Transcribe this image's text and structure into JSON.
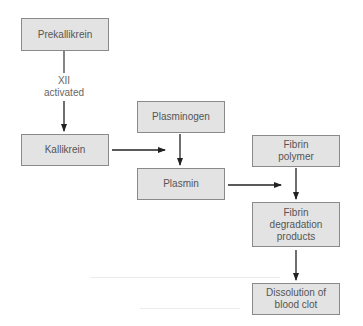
{
  "diagram": {
    "title": "",
    "nodes": [
      {
        "id": "prekallikrein",
        "label": "Prekallikrein"
      },
      {
        "id": "kallikrein",
        "label": "Kallikrein"
      },
      {
        "id": "plasminogen",
        "label": "Plasminogen"
      },
      {
        "id": "plasmin",
        "label": "Plasmin"
      },
      {
        "id": "fibrin_polymer",
        "label": "Fibrin\npolymer"
      },
      {
        "id": "fibrin_degradation",
        "label": "Fibrin\ndegradation\nproducts"
      },
      {
        "id": "dissolution",
        "label": "Dissolution of\nblood clot"
      }
    ],
    "edges": [
      {
        "from": "prekallikrein",
        "to": "kallikrein",
        "label": "XII\nactivated"
      },
      {
        "from": "kallikrein",
        "to": "plasminogen_to_plasmin",
        "label": ""
      },
      {
        "from": "plasminogen",
        "to": "plasmin",
        "label": ""
      },
      {
        "from": "plasmin",
        "to": "fibrin_polymer_to_degradation",
        "label": ""
      },
      {
        "from": "fibrin_polymer",
        "to": "fibrin_degradation",
        "label": ""
      },
      {
        "from": "fibrin_degradation",
        "to": "dissolution",
        "label": ""
      }
    ],
    "colors": {
      "box_fill": "#e3e3e3",
      "box_border": "#8a8a8a",
      "text": "#555555",
      "arrow": "#222222"
    }
  }
}
